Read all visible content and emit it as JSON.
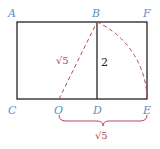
{
  "diagram": {
    "points": {
      "A": {
        "label": "A",
        "x": 17,
        "y": 22
      },
      "B": {
        "label": "B",
        "x": 97,
        "y": 22
      },
      "F": {
        "label": "F",
        "x": 147,
        "y": 22
      },
      "C": {
        "label": "C",
        "x": 17,
        "y": 99
      },
      "O": {
        "label": "O",
        "x": 59,
        "y": 99
      },
      "D": {
        "label": "D",
        "x": 97,
        "y": 99
      },
      "E": {
        "label": "E",
        "x": 147,
        "y": 99
      }
    },
    "labels": {
      "segment_OB": "√5",
      "segment_BD": "2",
      "brace_OE": "√5"
    },
    "colors": {
      "point_label": "#5b8ec9",
      "dashed": "#b5485a",
      "solid": "#222222"
    }
  }
}
